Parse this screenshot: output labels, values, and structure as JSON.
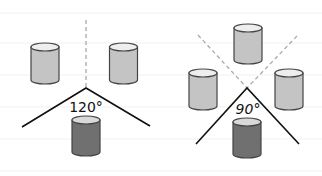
{
  "diagrams": [
    {
      "id": "left",
      "angle_label": "120°",
      "angle_degrees": 120,
      "cylinders": [
        {
          "role": "side",
          "shade": "light"
        },
        {
          "role": "side",
          "shade": "light"
        },
        {
          "role": "center-bottom",
          "shade": "dark"
        }
      ]
    },
    {
      "id": "right",
      "angle_label": "90°",
      "angle_degrees": 90,
      "cylinders": [
        {
          "role": "top",
          "shade": "light"
        },
        {
          "role": "side",
          "shade": "light"
        },
        {
          "role": "side",
          "shade": "light"
        },
        {
          "role": "center-bottom",
          "shade": "dark"
        }
      ]
    }
  ],
  "colors": {
    "light_body": "#c4c4c4",
    "light_top": "#eeeeee",
    "dark_body": "#707070",
    "dark_top": "#d9d9d9",
    "outline": "#444444",
    "line": "#111111",
    "dashed": "#aaaaaa"
  }
}
